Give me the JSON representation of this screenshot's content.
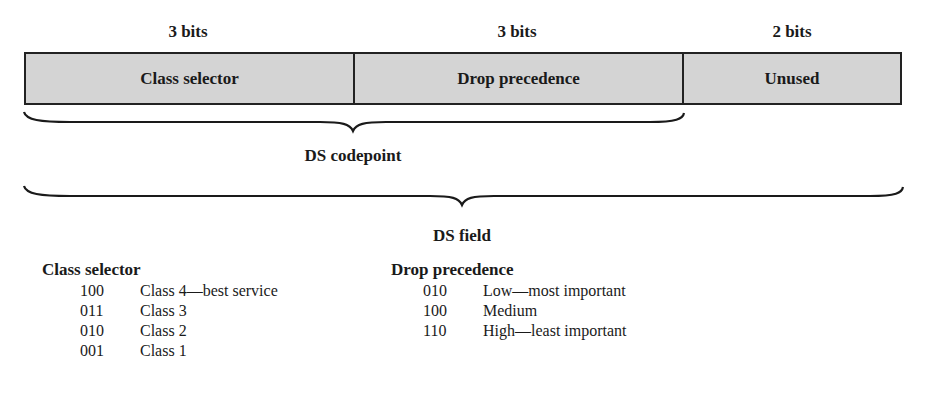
{
  "diagram": {
    "fields": [
      {
        "bits_label": "3 bits",
        "name": "Class selector"
      },
      {
        "bits_label": "3 bits",
        "name": "Drop precedence"
      },
      {
        "bits_label": "2 bits",
        "name": "Unused"
      }
    ],
    "braces": {
      "codepoint_label": "DS codepoint",
      "field_label": "DS field"
    },
    "colors": {
      "box_fill": "#d4d4d4",
      "border": "#222222"
    }
  },
  "legend": {
    "class_selector": {
      "title": "Class selector",
      "rows": [
        {
          "code": "100",
          "description": "Class 4—best service"
        },
        {
          "code": "011",
          "description": "Class 3"
        },
        {
          "code": "010",
          "description": "Class 2"
        },
        {
          "code": "001",
          "description": "Class 1"
        }
      ]
    },
    "drop_precedence": {
      "title": "Drop precedence",
      "rows": [
        {
          "code": "010",
          "description": "Low—most important"
        },
        {
          "code": "100",
          "description": "Medium"
        },
        {
          "code": "110",
          "description": "High—least important"
        }
      ]
    }
  }
}
